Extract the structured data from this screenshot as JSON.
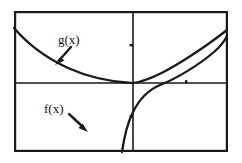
{
  "figure": {
    "type": "graph",
    "background_color": "#ffffff",
    "ink_color": "#1a1a1a",
    "frame": {
      "label": "plot-frame",
      "left": 14,
      "top": 11,
      "right": 228,
      "bottom": 152,
      "stroke_width": 2.2
    },
    "axes": {
      "x_axis": {
        "label": "x-axis",
        "y": 83,
        "x_start": 14,
        "x_end": 228
      },
      "y_axis": {
        "label": "y-axis",
        "x": 133,
        "y_start": 11,
        "y_end": 152
      },
      "origin": {
        "x": 133,
        "y": 83
      },
      "stroke_width": 1.6,
      "ticks": [
        {
          "name": "y-axis-tick-upper",
          "x": 133,
          "y": 45
        },
        {
          "name": "y-axis-tick-lower",
          "x": 133,
          "y": 116
        },
        {
          "name": "x-axis-tick-right",
          "x": 186,
          "y": 83
        }
      ]
    }
  },
  "chart_data": {
    "type": "line",
    "title": "",
    "xlabel": "",
    "ylabel": "",
    "grid": false,
    "legend": "inline-annotations",
    "axis_style": "centered-cartesian-axes-in-rectangular-frame",
    "xlim": [
      -2.2,
      2.3
    ],
    "ylim": [
      -1.5,
      1.5
    ],
    "series": [
      {
        "name": "g(x)",
        "description": "decreasing convex curve entering at upper-left, flattening toward the origin, then rising steeply to the upper-right corner",
        "points": [
          [
            14,
            28
          ],
          [
            22,
            37
          ],
          [
            32,
            45
          ],
          [
            44,
            54
          ],
          [
            57,
            62
          ],
          [
            72,
            69
          ],
          [
            88,
            75
          ],
          [
            104,
            79
          ],
          [
            118,
            81
          ],
          [
            133,
            83
          ],
          [
            150,
            79
          ],
          [
            166,
            72
          ],
          [
            182,
            63
          ],
          [
            196,
            54
          ],
          [
            210,
            45
          ],
          [
            220,
            38
          ],
          [
            227,
            31
          ]
        ]
      },
      {
        "name": "f(x)",
        "description": "increasing curve rising steeply from the bottom of the third quadrant through the origin then flattening as it rises to the right edge",
        "points": [
          [
            122,
            152
          ],
          [
            124,
            143
          ],
          [
            127,
            133
          ],
          [
            130,
            124
          ],
          [
            133,
            116
          ],
          [
            137,
            108
          ],
          [
            142,
            100
          ],
          [
            148,
            93
          ],
          [
            156,
            87
          ],
          [
            165,
            83
          ],
          [
            133,
            83
          ],
          [
            146,
            77
          ],
          [
            160,
            72
          ],
          [
            175,
            66
          ],
          [
            190,
            59
          ],
          [
            205,
            51
          ],
          [
            217,
            44
          ],
          [
            227,
            36
          ]
        ]
      }
    ],
    "annotations": [
      {
        "name": "g-label",
        "text": "g(x)",
        "text_x": 58,
        "text_y": 44,
        "arrow": {
          "x1": 72,
          "y1": 46,
          "x2": 57,
          "y2": 63
        }
      },
      {
        "name": "f-label",
        "text": "f(x)",
        "text_x": 44,
        "text_y": 113,
        "arrow": {
          "x1": 68,
          "y1": 113,
          "x2": 87,
          "y2": 130
        }
      }
    ]
  }
}
